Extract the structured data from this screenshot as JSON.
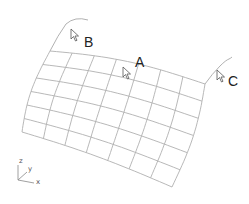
{
  "diagram": {
    "type": "warped-surface-mesh",
    "grid": {
      "columns": 7,
      "rows": 6,
      "line_color": "#b0b0b0"
    },
    "curve_color": "#a8a8a8",
    "cursor_color": "#666666",
    "labels": {
      "a": "A",
      "b": "B",
      "c": "C"
    },
    "axes": {
      "z": "z",
      "y": "y",
      "x": "x"
    }
  }
}
